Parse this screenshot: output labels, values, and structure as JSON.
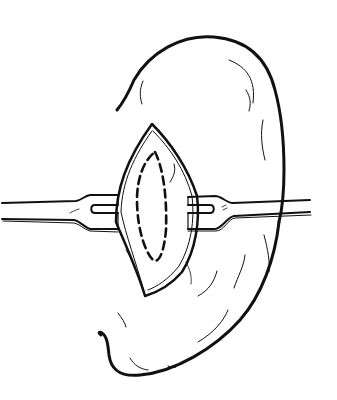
{
  "figure": {
    "title": "Surgical incision with retractors",
    "colors": {
      "stroke": "#111111",
      "background": "#ffffff"
    },
    "elements": {
      "organ": "organ-outline",
      "incision": "lens-shaped-incision",
      "excision_line": "dashed-oval",
      "retractor_left": "left-retractor",
      "retractor_right": "right-retractor"
    }
  }
}
